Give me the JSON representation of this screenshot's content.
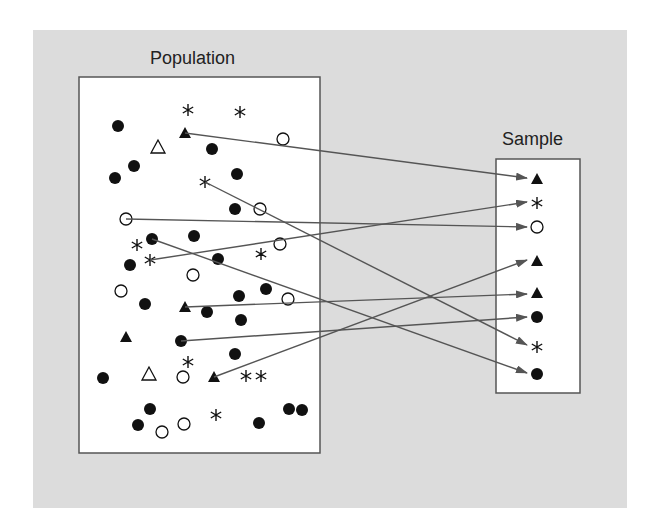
{
  "diagram": {
    "population_label": "Population",
    "sample_label": "Sample",
    "colors": {
      "background": "#dcdcdc",
      "box": "#ffffff",
      "stroke": "#555555",
      "marker": "#111111",
      "arrow": "#555555"
    },
    "population_box": {
      "x": 79,
      "y": 77,
      "w": 241,
      "h": 376
    },
    "sample_box": {
      "x": 496,
      "y": 159,
      "w": 84,
      "h": 234
    },
    "population_items": [
      {
        "shape": "star",
        "x": 188,
        "y": 110
      },
      {
        "shape": "star",
        "x": 240,
        "y": 112
      },
      {
        "shape": "dot",
        "x": 118,
        "y": 126
      },
      {
        "shape": "tri",
        "x": 185,
        "y": 133
      },
      {
        "shape": "open-tri",
        "x": 158,
        "y": 147
      },
      {
        "shape": "circle",
        "x": 283,
        "y": 139
      },
      {
        "shape": "dot",
        "x": 212,
        "y": 149
      },
      {
        "shape": "dot",
        "x": 134,
        "y": 166
      },
      {
        "shape": "dot",
        "x": 115,
        "y": 178
      },
      {
        "shape": "dot",
        "x": 237,
        "y": 174
      },
      {
        "shape": "star",
        "x": 205,
        "y": 182
      },
      {
        "shape": "dot",
        "x": 235,
        "y": 209
      },
      {
        "shape": "circle",
        "x": 260,
        "y": 209
      },
      {
        "shape": "circle",
        "x": 126,
        "y": 219
      },
      {
        "shape": "dot",
        "x": 152,
        "y": 239
      },
      {
        "shape": "dot",
        "x": 194,
        "y": 236
      },
      {
        "shape": "star",
        "x": 137,
        "y": 245
      },
      {
        "shape": "circle",
        "x": 280,
        "y": 244
      },
      {
        "shape": "star",
        "x": 261,
        "y": 254
      },
      {
        "shape": "star",
        "x": 150,
        "y": 260
      },
      {
        "shape": "dot",
        "x": 130,
        "y": 265
      },
      {
        "shape": "dot",
        "x": 218,
        "y": 259
      },
      {
        "shape": "circle",
        "x": 193,
        "y": 275
      },
      {
        "shape": "circle",
        "x": 121,
        "y": 291
      },
      {
        "shape": "dot",
        "x": 266,
        "y": 289
      },
      {
        "shape": "dot",
        "x": 239,
        "y": 296
      },
      {
        "shape": "circle",
        "x": 288,
        "y": 299
      },
      {
        "shape": "dot",
        "x": 145,
        "y": 304
      },
      {
        "shape": "tri",
        "x": 185,
        "y": 307
      },
      {
        "shape": "dot",
        "x": 207,
        "y": 312
      },
      {
        "shape": "dot",
        "x": 241,
        "y": 320
      },
      {
        "shape": "tri",
        "x": 126,
        "y": 337
      },
      {
        "shape": "dot",
        "x": 181,
        "y": 341
      },
      {
        "shape": "dot",
        "x": 235,
        "y": 354
      },
      {
        "shape": "star",
        "x": 188,
        "y": 362
      },
      {
        "shape": "dot",
        "x": 103,
        "y": 378
      },
      {
        "shape": "open-tri",
        "x": 149,
        "y": 374
      },
      {
        "shape": "circle",
        "x": 183,
        "y": 377
      },
      {
        "shape": "tri",
        "x": 214,
        "y": 377
      },
      {
        "shape": "star",
        "x": 246,
        "y": 376
      },
      {
        "shape": "star",
        "x": 261,
        "y": 376
      },
      {
        "shape": "dot",
        "x": 150,
        "y": 409
      },
      {
        "shape": "dot",
        "x": 138,
        "y": 425
      },
      {
        "shape": "circle",
        "x": 162,
        "y": 432
      },
      {
        "shape": "circle",
        "x": 184,
        "y": 424
      },
      {
        "shape": "star",
        "x": 216,
        "y": 415
      },
      {
        "shape": "dot",
        "x": 259,
        "y": 423
      },
      {
        "shape": "dot",
        "x": 289,
        "y": 409
      },
      {
        "shape": "dot",
        "x": 302,
        "y": 410
      }
    ],
    "sample_items": [
      {
        "shape": "tri",
        "x": 537,
        "y": 179
      },
      {
        "shape": "star",
        "x": 537,
        "y": 203
      },
      {
        "shape": "circle",
        "x": 537,
        "y": 227
      },
      {
        "shape": "tri",
        "x": 537,
        "y": 261
      },
      {
        "shape": "tri",
        "x": 537,
        "y": 293
      },
      {
        "shape": "dot",
        "x": 537,
        "y": 317
      },
      {
        "shape": "star",
        "x": 537,
        "y": 347
      },
      {
        "shape": "dot",
        "x": 537,
        "y": 374
      }
    ],
    "arrows": [
      {
        "from": [
          185,
          133
        ],
        "to": [
          527,
          178
        ]
      },
      {
        "from": [
          150,
          260
        ],
        "to": [
          527,
          202
        ]
      },
      {
        "from": [
          126,
          219
        ],
        "to": [
          527,
          227
        ]
      },
      {
        "from": [
          214,
          377
        ],
        "to": [
          527,
          260
        ]
      },
      {
        "from": [
          185,
          307
        ],
        "to": [
          527,
          294
        ]
      },
      {
        "from": [
          181,
          341
        ],
        "to": [
          527,
          317
        ]
      },
      {
        "from": [
          205,
          182
        ],
        "to": [
          527,
          345
        ]
      },
      {
        "from": [
          152,
          239
        ],
        "to": [
          527,
          373
        ]
      }
    ]
  }
}
